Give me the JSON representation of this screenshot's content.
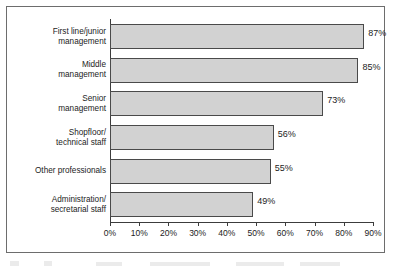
{
  "chart_data": {
    "type": "bar",
    "orientation": "horizontal",
    "title": "",
    "xlabel": "",
    "ylabel": "",
    "categories": [
      "First line/junior management",
      "Middle management",
      "Senior management",
      "Shopfloor/ technical staff",
      "Other professionals",
      "Administration/ secretarial staff"
    ],
    "category_lines": [
      [
        "First line/junior",
        "management"
      ],
      [
        "Middle",
        "management"
      ],
      [
        "Senior",
        "management"
      ],
      [
        "Shopfloor/",
        "technical staff"
      ],
      [
        "Other professionals"
      ],
      [
        "Administration/",
        "secretarial staff"
      ]
    ],
    "values": [
      87,
      85,
      73,
      56,
      55,
      49
    ],
    "value_labels": [
      "87%",
      "85%",
      "73%",
      "56%",
      "55%",
      "49%"
    ],
    "xlim": [
      0,
      90
    ],
    "xticks": [
      0,
      10,
      20,
      30,
      40,
      50,
      60,
      70,
      80,
      90
    ],
    "xtick_labels": [
      "0%",
      "10%",
      "20%",
      "30%",
      "40%",
      "50%",
      "60%",
      "70%",
      "80%",
      "90%"
    ],
    "grid": false,
    "legend": null,
    "bar_color": "#d2d2d2",
    "bar_border_color": "#4a4a4a",
    "axis_color": "#3c3c3c",
    "text_color": "#1c1c1c",
    "background": "#ffffff"
  }
}
